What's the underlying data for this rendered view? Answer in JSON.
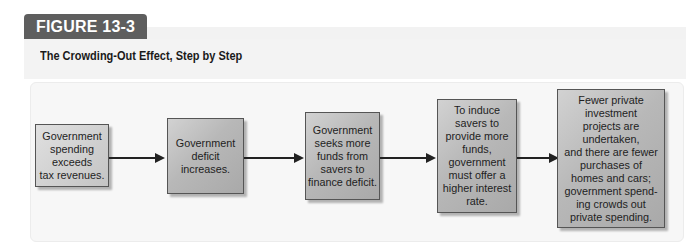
{
  "figure": {
    "label": "FIGURE 13-3",
    "title": "The Crowding-Out Effect, Step by Step"
  },
  "steps": [
    {
      "text": "Government\nspending\nexceeds\ntax revenues."
    },
    {
      "text": "Government\ndeficit\nincreases."
    },
    {
      "text": "Government\nseeks more\nfunds from\nsavers to\nfinance deficit."
    },
    {
      "text": "To induce\nsavers to\nprovide more\nfunds,\ngovernment\nmust offer a\nhigher interest\nrate."
    },
    {
      "text": "Fewer private\ninvestment\nprojects are\nundertaken,\nand there are fewer\npurchases of\nhomes and cars;\ngovernment spend-\ning crowds out\nprivate spending."
    }
  ],
  "colors": {
    "label_bg": "#5e5e5e",
    "box_fill": "#b8b8b8",
    "arrow": "#222222"
  }
}
